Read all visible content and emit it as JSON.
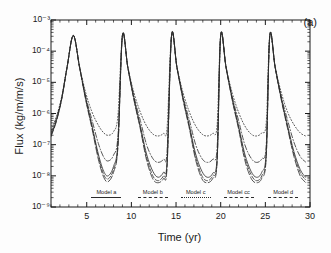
{
  "panel": {
    "tag": "(a)"
  },
  "axes": {
    "xlabel": "Time (yr)",
    "ylabel": "Flux (kg/m/m/s)",
    "xticks": [
      "5",
      "10",
      "15",
      "20",
      "25",
      "30"
    ],
    "yticks": [
      "10⁻³",
      "10⁻⁴",
      "10⁻⁵",
      "10⁻⁶",
      "10⁻⁷",
      "10⁻⁸",
      "10⁻⁹"
    ]
  },
  "chart_data": {
    "type": "line",
    "title": "",
    "xlabel": "Time (yr)",
    "ylabel": "Flux (kg/m/m/s)",
    "xlim": [
      1,
      30
    ],
    "ylim": [
      1e-09,
      0.001
    ],
    "yscale": "log",
    "xscale": "linear",
    "grid": false,
    "legend_position": "bottom-inside",
    "xticks": [
      5,
      10,
      15,
      20,
      25,
      30
    ],
    "yticks": [
      0.001,
      0.0001,
      1e-05,
      1e-06,
      1e-07,
      1e-08,
      1e-09
    ],
    "annotations": [
      "(a)"
    ],
    "period_yr": 5.5,
    "peak_times": [
      3.5,
      9.0,
      14.5,
      20.0,
      25.5
    ],
    "peak_flux": 0.00032,
    "series": [
      {
        "name": "Model a",
        "style": "solid",
        "trough_flux": 1e-08,
        "x": [
          1.0,
          1.6,
          2.2,
          2.8,
          3.5,
          4.2,
          4.9,
          5.6,
          6.3,
          6.9,
          7.4,
          8.0,
          8.5,
          9.0,
          9.6,
          10.3,
          11.0,
          11.7,
          12.4,
          13.0,
          13.6,
          14.0,
          14.5,
          15.1,
          15.8,
          16.5,
          17.2,
          17.9,
          18.5,
          19.1,
          19.6,
          20.0,
          20.6,
          21.3,
          22.0,
          22.7,
          23.4,
          24.0,
          24.6,
          25.1,
          25.5,
          26.1,
          26.8,
          27.5,
          28.2,
          28.9,
          29.5
        ],
        "y": [
          2e-07,
          6e-07,
          3e-06,
          3e-05,
          0.00032,
          3e-05,
          3e-06,
          4e-07,
          5e-08,
          1.4e-08,
          1e-08,
          2e-08,
          1.2e-07,
          0.00032,
          3e-05,
          3e-06,
          4e-07,
          5e-08,
          1.4e-08,
          9e-09,
          1.3e-08,
          3e-08,
          0.00032,
          3e-05,
          3e-06,
          4e-07,
          5e-08,
          1.4e-08,
          9e-09,
          1.2e-08,
          4e-08,
          0.00032,
          3e-05,
          3e-06,
          4e-07,
          5e-08,
          1.4e-08,
          9e-09,
          1.3e-08,
          6e-08,
          0.00032,
          3e-05,
          3e-06,
          4e-07,
          6e-08,
          1.6e-08,
          9e-09
        ]
      },
      {
        "name": "Model b",
        "style": "dashed",
        "trough_flux": 8e-09,
        "x": [
          1.0,
          1.6,
          2.2,
          2.8,
          3.5,
          4.2,
          4.9,
          5.6,
          6.3,
          6.9,
          7.4,
          8.0,
          8.5,
          9.0,
          9.6,
          10.3,
          11.0,
          11.7,
          12.4,
          13.0,
          13.6,
          14.0,
          14.5,
          15.1,
          15.8,
          16.5,
          17.2,
          17.9,
          18.5,
          19.1,
          19.6,
          20.0,
          20.6,
          21.3,
          22.0,
          22.7,
          23.4,
          24.0,
          24.6,
          25.1,
          25.5,
          26.1,
          26.8,
          27.5,
          28.2,
          28.9,
          29.5
        ],
        "y": [
          2e-07,
          6e-07,
          3e-06,
          3e-05,
          0.00032,
          3e-05,
          2.8e-06,
          3.6e-07,
          4.2e-08,
          1.1e-08,
          8e-09,
          1.6e-08,
          1e-07,
          0.00032,
          3e-05,
          2.8e-06,
          3.6e-07,
          4e-08,
          1e-08,
          7e-09,
          1e-08,
          2.4e-08,
          0.00032,
          3e-05,
          2.8e-06,
          3.6e-07,
          4e-08,
          1e-08,
          7e-09,
          1e-08,
          3.2e-08,
          0.00032,
          3e-05,
          2.8e-06,
          3.6e-07,
          4e-08,
          1.1e-08,
          7e-09,
          1e-08,
          4.6e-08,
          0.00032,
          3e-05,
          2.8e-06,
          3.6e-07,
          5e-08,
          1.3e-08,
          7.5e-09
        ]
      },
      {
        "name": "Model c",
        "style": "dotted",
        "trough_flux": 2e-07,
        "x": [
          1.0,
          1.6,
          2.2,
          2.8,
          3.5,
          4.2,
          4.9,
          5.6,
          6.3,
          6.9,
          7.4,
          8.0,
          8.5,
          9.0,
          9.6,
          10.3,
          11.0,
          11.7,
          12.4,
          13.0,
          13.6,
          14.0,
          14.5,
          15.1,
          15.8,
          16.5,
          17.2,
          17.9,
          18.5,
          19.1,
          19.6,
          20.0,
          20.6,
          21.3,
          22.0,
          22.7,
          23.4,
          24.0,
          24.6,
          25.1,
          25.5,
          26.1,
          26.8,
          27.5,
          28.2,
          28.9,
          29.5
        ],
        "y": [
          3e-07,
          8e-07,
          3.5e-06,
          3.2e-05,
          0.00032,
          3.2e-05,
          4.5e-06,
          1.1e-06,
          4.2e-07,
          2.4e-07,
          2e-07,
          2.6e-07,
          9e-07,
          0.00032,
          3.2e-05,
          4.5e-06,
          1.1e-06,
          4e-07,
          2.2e-07,
          1.9e-07,
          2.3e-07,
          3.6e-07,
          0.00032,
          3.2e-05,
          4.5e-06,
          1.1e-06,
          4e-07,
          2.2e-07,
          1.9e-07,
          2.3e-07,
          4.2e-07,
          0.00032,
          3.2e-05,
          4.5e-06,
          1.1e-06,
          4e-07,
          2.2e-07,
          1.9e-07,
          2.4e-07,
          5.2e-07,
          0.00032,
          3.2e-05,
          4.5e-06,
          1.1e-06,
          4.4e-07,
          2.4e-07,
          1.9e-07
        ]
      },
      {
        "name": "Model cc",
        "style": "dashdot",
        "trough_flux": 3e-08,
        "x": [
          1.0,
          1.6,
          2.2,
          2.8,
          3.5,
          4.2,
          4.9,
          5.6,
          6.3,
          6.9,
          7.4,
          8.0,
          8.5,
          9.0,
          9.6,
          10.3,
          11.0,
          11.7,
          12.4,
          13.0,
          13.6,
          14.0,
          14.5,
          15.1,
          15.8,
          16.5,
          17.2,
          17.9,
          18.5,
          19.1,
          19.6,
          20.0,
          20.6,
          21.3,
          22.0,
          22.7,
          23.4,
          24.0,
          24.6,
          25.1,
          25.5,
          26.1,
          26.8,
          27.5,
          28.2,
          28.9,
          29.5
        ],
        "y": [
          2.4e-07,
          7e-07,
          3.2e-06,
          3.1e-05,
          0.00032,
          3.1e-05,
          3.4e-06,
          6e-07,
          1.1e-07,
          4e-08,
          3e-08,
          4.6e-08,
          2e-07,
          0.00032,
          3.1e-05,
          3.4e-06,
          6e-07,
          1e-07,
          3.6e-08,
          2.7e-08,
          3.4e-08,
          6.5e-08,
          0.00032,
          3.1e-05,
          3.4e-06,
          6e-07,
          1e-07,
          3.6e-08,
          2.7e-08,
          3.4e-08,
          8e-08,
          0.00032,
          3.1e-05,
          3.4e-06,
          6e-07,
          1e-07,
          3.7e-08,
          2.7e-08,
          3.5e-08,
          1e-07,
          0.00032,
          3.1e-05,
          3.4e-06,
          6e-07,
          1.2e-07,
          4.2e-08,
          2.8e-08
        ]
      },
      {
        "name": "Model d",
        "style": "longdash",
        "trough_flux": 6e-09,
        "x": [
          1.0,
          1.6,
          2.2,
          2.8,
          3.5,
          4.2,
          4.9,
          5.6,
          6.3,
          6.9,
          7.4,
          8.0,
          8.5,
          9.0,
          9.6,
          10.3,
          11.0,
          11.7,
          12.4,
          13.0,
          13.6,
          14.0,
          14.5,
          15.1,
          15.8,
          16.5,
          17.2,
          17.9,
          18.5,
          19.1,
          19.6,
          20.0,
          20.6,
          21.3,
          22.0,
          22.7,
          23.4,
          24.0,
          24.6,
          25.1,
          25.5,
          26.1,
          26.8,
          27.5,
          28.2,
          28.9,
          29.5
        ],
        "y": [
          1.8e-07,
          5.5e-07,
          2.9e-06,
          3e-05,
          0.00032,
          3e-05,
          2.6e-06,
          3.2e-07,
          3.4e-08,
          9e-09,
          6.5e-09,
          1.3e-08,
          9e-08,
          0.00032,
          3e-05,
          2.6e-06,
          3.2e-07,
          3.2e-08,
          8e-09,
          6e-09,
          8.2e-09,
          2e-08,
          0.00032,
          3e-05,
          2.6e-06,
          3.2e-07,
          3.2e-08,
          8e-09,
          6e-09,
          8.2e-09,
          2.8e-08,
          0.00032,
          3e-05,
          2.6e-06,
          3.2e-07,
          3.2e-08,
          8.4e-09,
          6e-09,
          8.4e-09,
          4e-08,
          0.00032,
          3e-05,
          2.6e-06,
          3.2e-07,
          4.2e-08,
          1e-08,
          6.2e-09
        ]
      }
    ]
  },
  "legend": {
    "entries": [
      {
        "label": "Model a",
        "style": "solid",
        "x_yr": 7.2
      },
      {
        "label": "Model b",
        "style": "dashed",
        "x_yr": 12.4
      },
      {
        "label": "Model c",
        "style": "dotted",
        "x_yr": 17.2
      },
      {
        "label": "Model cc",
        "style": "dashdot",
        "x_yr": 22.0
      },
      {
        "label": "Model d",
        "style": "longdash",
        "x_yr": 27.0
      }
    ]
  },
  "colors": {
    "axis": "#1a1a1a",
    "curve": "#2b2b2b",
    "background": "#ffffff"
  }
}
